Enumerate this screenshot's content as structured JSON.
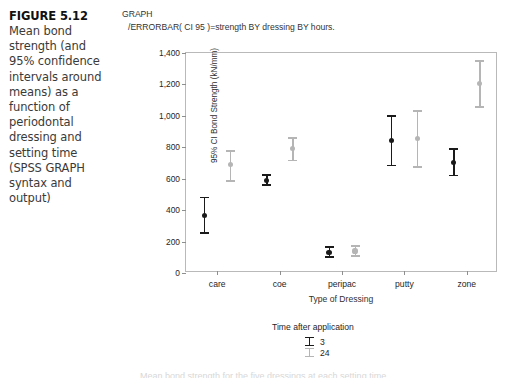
{
  "figure": {
    "number": "FIGURE 5.12",
    "caption": "Mean bond strength (and 95% confidence intervals around means) as a function of periodontal dressing and setting time (SPSS GRAPH syntax and output)"
  },
  "syntax": {
    "line1": "GRAPH",
    "line2": "/ERRORBAR( CI 95 )=strength BY dressing BY hours."
  },
  "legend": {
    "title": "Time after application",
    "entries": [
      {
        "label": "3",
        "color": "#1a1a1a"
      },
      {
        "label": "24",
        "color": "#b5b5b5"
      }
    ]
  },
  "footer": {
    "ghost_text": "Mean bond strength for the five dressings at each setting time"
  },
  "chart_data": {
    "type": "scatter",
    "title": "",
    "xlabel": "Type of Dressing",
    "ylabel": "95% CI Bond Strength (kN/mm)",
    "categories": [
      "care",
      "coe",
      "peripac",
      "putty",
      "zone"
    ],
    "ylim": [
      0,
      1400
    ],
    "yticks": [
      0,
      200,
      400,
      600,
      800,
      1000,
      1200,
      1400
    ],
    "ytick_labels": [
      "0",
      "200",
      "400",
      "600",
      "800",
      "1,000",
      "1,200",
      "1,400"
    ],
    "grid": false,
    "legend_position": "below",
    "error_type": "95% CI",
    "series": [
      {
        "name": "3",
        "color": "#1a1a1a",
        "means": [
          365,
          590,
          130,
          845,
          705
        ],
        "ci_lower": [
          255,
          560,
          100,
          685,
          620
        ],
        "ci_upper": [
          480,
          625,
          165,
          1000,
          790
        ]
      },
      {
        "name": "24",
        "color": "#b5b5b5",
        "means": [
          690,
          790,
          140,
          855,
          1205
        ],
        "ci_lower": [
          585,
          715,
          110,
          675,
          1055
        ],
        "ci_upper": [
          775,
          860,
          170,
          1030,
          1350
        ]
      }
    ]
  }
}
